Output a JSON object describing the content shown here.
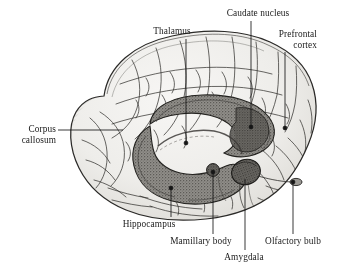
{
  "figure": {
    "type": "anatomical-illustration",
    "style": "grayscale engraving / stipple line drawing",
    "background_color": "#ffffff",
    "ink_color": "#1a1a1a",
    "cortex_fill": "#f0efed",
    "limbic_fill": "#8d8b86",
    "limbic_dark": "#5e5c58"
  },
  "labels": [
    {
      "id": "thalamus",
      "text": "Thalamus",
      "align": "center",
      "x": 172,
      "y": 26,
      "leader": {
        "x1": 186,
        "y1": 39,
        "x2": 186,
        "y2": 142
      },
      "dot": {
        "x": 186,
        "y": 143
      }
    },
    {
      "id": "caudate-nucleus",
      "text": "Caudate nucleus",
      "align": "center",
      "x": 215,
      "y": 8,
      "leader": {
        "x1": 251,
        "y1": 21,
        "x2": 251,
        "y2": 126
      },
      "dot": {
        "x": 251,
        "y": 127
      }
    },
    {
      "id": "prefrontal-cortex",
      "text": "Prefrontal\ncortex",
      "align": "right",
      "x": 273,
      "y": 29,
      "leader": {
        "x1": 285,
        "y1": 52,
        "x2": 285,
        "y2": 127
      },
      "dot": {
        "x": 285,
        "y": 128
      }
    },
    {
      "id": "corpus-callosum",
      "text": "Corpus\ncallosum",
      "align": "right",
      "x": 8,
      "y": 124,
      "leader": {
        "x1": 58,
        "y1": 130,
        "x2": 123,
        "y2": 130
      },
      "dot": null
    },
    {
      "id": "hippocampus",
      "text": "Hippocampus",
      "align": "center",
      "x": 104,
      "y": 219,
      "leader": {
        "x1": 171,
        "y1": 217,
        "x2": 171,
        "y2": 189
      },
      "dot": {
        "x": 171,
        "y": 188
      }
    },
    {
      "id": "mamillary-body",
      "text": "Mamillary body",
      "align": "center",
      "x": 164,
      "y": 236,
      "leader": {
        "x1": 213,
        "y1": 234,
        "x2": 213,
        "y2": 173
      },
      "dot": {
        "x": 213,
        "y": 172
      }
    },
    {
      "id": "amygdala",
      "text": "Amygdala",
      "align": "center",
      "x": 218,
      "y": 252,
      "leader": {
        "x1": 245,
        "y1": 250,
        "x2": 245,
        "y2": 179
      },
      "dot": {
        "x": 245,
        "y": 178
      }
    },
    {
      "id": "olfactory-bulb",
      "text": "Olfactory bulb",
      "align": "center",
      "x": 255,
      "y": 236,
      "leader": {
        "x1": 293,
        "y1": 234,
        "x2": 293,
        "y2": 183
      },
      "dot": {
        "x": 293,
        "y": 182
      }
    }
  ],
  "structures": [
    {
      "id": "cerebral-cortex",
      "name": "Cerebral cortex (gyri and sulci)"
    },
    {
      "id": "corpus-callosum",
      "name": "Corpus callosum"
    },
    {
      "id": "caudate-nucleus",
      "name": "Caudate nucleus"
    },
    {
      "id": "thalamus",
      "name": "Thalamus"
    },
    {
      "id": "hippocampus",
      "name": "Hippocampus"
    },
    {
      "id": "fornix",
      "name": "Fornix"
    },
    {
      "id": "mamillary-body",
      "name": "Mamillary body"
    },
    {
      "id": "amygdala",
      "name": "Amygdala"
    },
    {
      "id": "olfactory-bulb",
      "name": "Olfactory bulb"
    },
    {
      "id": "brainstem",
      "name": "Brainstem / temporal pole"
    }
  ]
}
